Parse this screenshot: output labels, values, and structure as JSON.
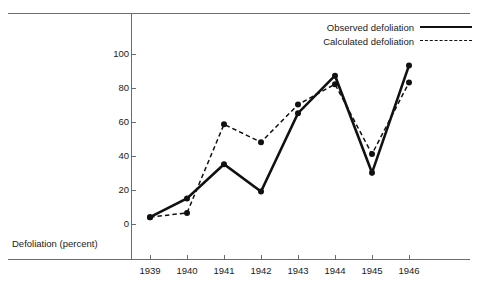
{
  "chart_data": {
    "type": "line",
    "title": "",
    "subtitle": "",
    "xlabel": "",
    "ylabel": "Defoliation (percent)",
    "categories": [
      "1939",
      "1940",
      "1941",
      "1942",
      "1943",
      "1944",
      "1945",
      "1946"
    ],
    "x": [
      1939,
      1940,
      1941,
      1942,
      1943,
      1944,
      1945,
      1946
    ],
    "xlim": [
      1938.5,
      1946.5
    ],
    "ylim": [
      0,
      108
    ],
    "yticks": [
      0,
      20,
      40,
      60,
      80,
      100
    ],
    "ytick_labels": [
      "0",
      "20",
      "40",
      "60",
      "80",
      "100"
    ],
    "grid": false,
    "legend_position": "top-right",
    "series": [
      {
        "name": "Observed defoliation",
        "style": "solid",
        "color": "#111111",
        "marker": "filled-circle",
        "values": [
          4,
          15,
          35,
          19,
          65,
          87,
          30,
          93
        ]
      },
      {
        "name": "Calculated defoliation",
        "style": "dashed",
        "color": "#111111",
        "marker": "filled-circle",
        "values": [
          4,
          6.5,
          58.5,
          48,
          70,
          82,
          41,
          83
        ]
      }
    ]
  },
  "axis": {
    "y_title": "Defoliation (percent)"
  },
  "legend": {
    "items": [
      {
        "label": "Observed defoliation",
        "style": "solid"
      },
      {
        "label": "Calculated defoliation",
        "style": "dashed"
      }
    ]
  }
}
